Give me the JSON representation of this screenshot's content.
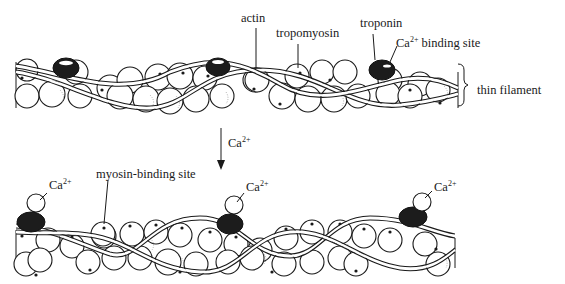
{
  "figure": {
    "colors": {
      "ink": "#1a1a1a",
      "background": "#ffffff",
      "troponin": "#1c1c1c"
    }
  },
  "top_panel": {
    "state": "relaxed (no Ca2+ bound)",
    "labels": {
      "actin": "actin",
      "tropomyosin": "tropomyosin",
      "troponin": "troponin",
      "ca_binding_site_ion": "Ca",
      "ca_binding_site_charge": "2+",
      "ca_binding_site_text": " binding site",
      "bracket": "thin filament"
    }
  },
  "transition": {
    "arrow_label_ion": "Ca",
    "arrow_label_charge": "2+"
  },
  "bottom_panel": {
    "state": "activated (Ca2+ bound to troponin)",
    "labels": {
      "myosin_binding_site": "myosin-binding site",
      "ca_labels": [
        {
          "ion": "Ca",
          "charge": "2+"
        },
        {
          "ion": "Ca",
          "charge": "2+"
        },
        {
          "ion": "Ca",
          "charge": "2+"
        }
      ]
    }
  }
}
